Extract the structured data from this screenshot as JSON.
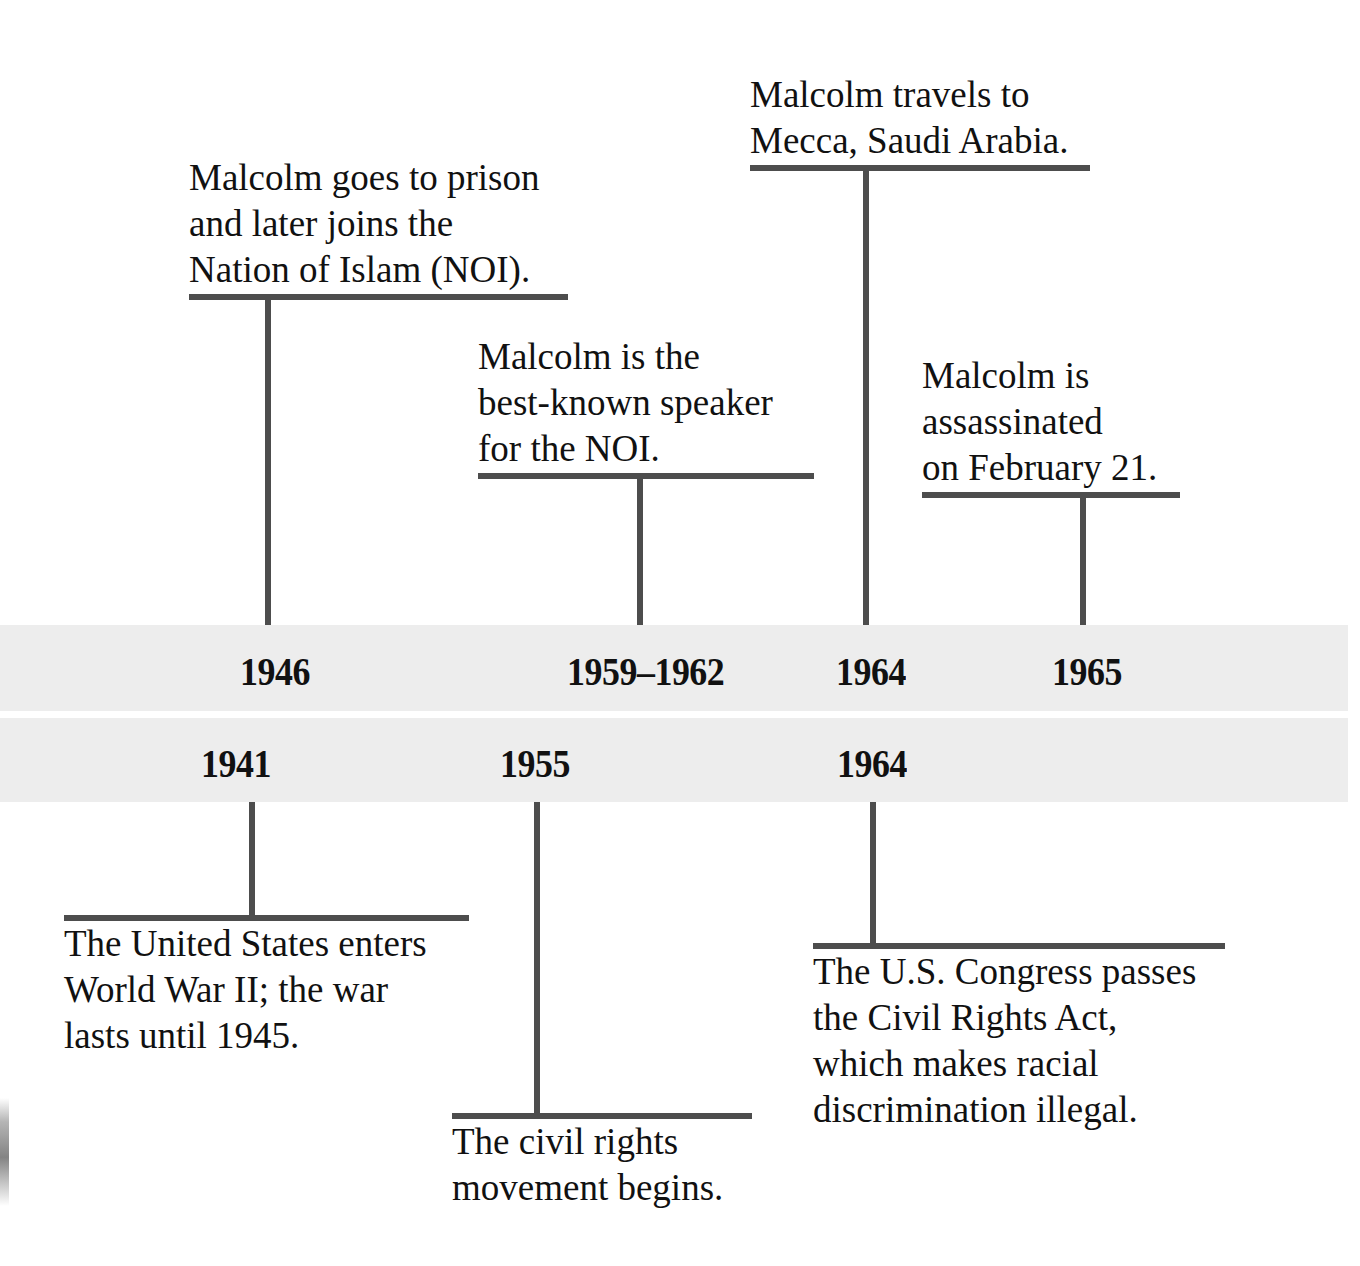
{
  "figure": {
    "type": "timeline",
    "orientation": "horizontal",
    "bands": 2,
    "band_color": "#ededed",
    "rule_color": "#4d4d4d",
    "text_color": "#111111",
    "background": "#ffffff"
  },
  "upper_band": {
    "name": "malcolm-x-life-events",
    "years": [
      {
        "label": "1946"
      },
      {
        "label": "1959–1962"
      },
      {
        "label": "1964"
      },
      {
        "label": "1965"
      }
    ]
  },
  "lower_band": {
    "name": "u-s-historical-events",
    "years": [
      {
        "label": "1941"
      },
      {
        "label": "1955"
      },
      {
        "label": "1964"
      }
    ]
  },
  "upper_callouts": [
    {
      "year": "1946",
      "lines": [
        "Malcolm goes to prison",
        "and later joins the",
        "Nation of Islam (NOI)."
      ]
    },
    {
      "year": "1959–1962",
      "lines": [
        "Malcolm is the",
        "best-known speaker",
        "for the NOI."
      ]
    },
    {
      "year": "1964",
      "lines": [
        "Malcolm travels to",
        "Mecca, Saudi Arabia."
      ]
    },
    {
      "year": "1965",
      "lines": [
        "Malcolm is",
        "assassinated",
        "on February 21."
      ]
    }
  ],
  "lower_callouts": [
    {
      "year": "1941",
      "lines": [
        "The United States enters",
        "World War II; the war",
        "lasts until 1945."
      ]
    },
    {
      "year": "1955",
      "lines": [
        "The civil rights",
        "movement begins."
      ]
    },
    {
      "year": "1964",
      "lines": [
        "The U.S. Congress passes",
        "the Civil Rights Act,",
        "which makes racial",
        "discrimination illegal."
      ]
    }
  ]
}
